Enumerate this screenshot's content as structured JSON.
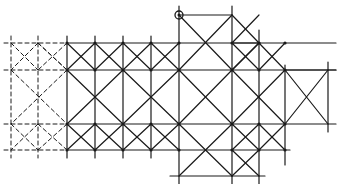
{
  "diagram": {
    "title": "",
    "colors": {
      "ink": "#1a1a1a",
      "background": "#ffffff"
    },
    "columns_x": [
      11,
      38,
      67,
      95,
      123,
      151,
      179,
      232,
      259,
      285,
      328
    ],
    "rows_y": [
      15,
      43,
      70,
      97,
      124,
      150,
      176
    ],
    "marker": {
      "type": "circled-node",
      "x": 179,
      "y": 15
    },
    "dashed_lines": [
      [
        4,
        43,
        67,
        43
      ],
      [
        4,
        70,
        67,
        70
      ],
      [
        4,
        124,
        67,
        124
      ],
      [
        4,
        150,
        67,
        150
      ],
      [
        11,
        36,
        11,
        158
      ],
      [
        38,
        36,
        38,
        158
      ],
      [
        11,
        43,
        38,
        70
      ],
      [
        38,
        43,
        11,
        70
      ],
      [
        11,
        124,
        38,
        150
      ],
      [
        38,
        124,
        11,
        150
      ],
      [
        38,
        43,
        67,
        70
      ],
      [
        67,
        43,
        38,
        70
      ],
      [
        38,
        124,
        67,
        150
      ],
      [
        67,
        124,
        38,
        150
      ],
      [
        11,
        70,
        67,
        124
      ],
      [
        67,
        70,
        11,
        124
      ],
      [
        38,
        43,
        67,
        70
      ]
    ],
    "solid_lines": [
      [
        67,
        43,
        336,
        43
      ],
      [
        67,
        70,
        336,
        70
      ],
      [
        67,
        124,
        336,
        124
      ],
      [
        67,
        150,
        290,
        150
      ],
      [
        179,
        15,
        232,
        15
      ],
      [
        232,
        43,
        260,
        43
      ],
      [
        285,
        70,
        336,
        70
      ],
      [
        67,
        36,
        67,
        158
      ],
      [
        95,
        36,
        95,
        158
      ],
      [
        123,
        36,
        123,
        158
      ],
      [
        151,
        36,
        151,
        158
      ],
      [
        179,
        6,
        179,
        184
      ],
      [
        232,
        6,
        232,
        184
      ],
      [
        259,
        30,
        259,
        184
      ],
      [
        285,
        65,
        285,
        165
      ],
      [
        328,
        62,
        328,
        132
      ],
      [
        67,
        43,
        95,
        70
      ],
      [
        95,
        43,
        67,
        70
      ],
      [
        95,
        43,
        123,
        70
      ],
      [
        123,
        43,
        95,
        70
      ],
      [
        123,
        43,
        151,
        70
      ],
      [
        151,
        43,
        123,
        70
      ],
      [
        151,
        43,
        179,
        70
      ],
      [
        179,
        43,
        151,
        70
      ],
      [
        67,
        124,
        95,
        150
      ],
      [
        95,
        124,
        67,
        150
      ],
      [
        95,
        124,
        123,
        150
      ],
      [
        123,
        124,
        95,
        150
      ],
      [
        123,
        124,
        151,
        150
      ],
      [
        151,
        124,
        123,
        150
      ],
      [
        151,
        124,
        179,
        150
      ],
      [
        179,
        124,
        151,
        150
      ],
      [
        67,
        70,
        123,
        124
      ],
      [
        123,
        70,
        67,
        124
      ],
      [
        123,
        70,
        179,
        124
      ],
      [
        179,
        70,
        123,
        124
      ],
      [
        179,
        15,
        232,
        70
      ],
      [
        232,
        15,
        179,
        70
      ],
      [
        232,
        15,
        259,
        43
      ],
      [
        259,
        43,
        232,
        70
      ],
      [
        232,
        43,
        259,
        15
      ],
      [
        232,
        43,
        259,
        70
      ],
      [
        259,
        43,
        232,
        70
      ],
      [
        259,
        43,
        285,
        70
      ],
      [
        285,
        43,
        259,
        70
      ],
      [
        179,
        70,
        232,
        124
      ],
      [
        232,
        70,
        179,
        124
      ],
      [
        232,
        70,
        285,
        124
      ],
      [
        285,
        70,
        232,
        124
      ],
      [
        285,
        70,
        328,
        124
      ],
      [
        328,
        70,
        285,
        124
      ],
      [
        179,
        124,
        232,
        176
      ],
      [
        232,
        124,
        179,
        176
      ],
      [
        232,
        124,
        259,
        150
      ],
      [
        259,
        124,
        232,
        150
      ],
      [
        259,
        124,
        285,
        150
      ],
      [
        285,
        124,
        259,
        150
      ],
      [
        232,
        150,
        259,
        176
      ],
      [
        259,
        150,
        232,
        176
      ],
      [
        170,
        176,
        265,
        176
      ]
    ]
  }
}
